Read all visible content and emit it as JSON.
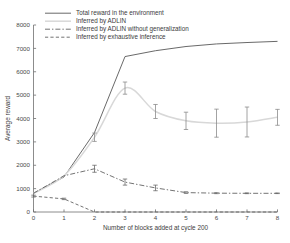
{
  "chart_data": {
    "type": "line",
    "title": "",
    "xlabel": "Number of blocks added at cycle 200",
    "ylabel": "Average reward",
    "xlim": [
      0,
      8
    ],
    "ylim": [
      0,
      8000
    ],
    "xticks": [
      "0",
      "1",
      "2",
      "3",
      "4",
      "5",
      "6",
      "7",
      "8"
    ],
    "yticks": [
      "0",
      "1000",
      "2000",
      "3000",
      "4000",
      "5000",
      "6000",
      "7000",
      "8000"
    ],
    "grid": false,
    "legend_position": "top-left",
    "x": [
      0,
      1,
      2,
      3,
      4,
      5,
      6,
      7,
      8
    ],
    "series": [
      {
        "name": "Total reward in the environment",
        "style": "solid",
        "color": "#585858",
        "values": [
          800,
          1500,
          3400,
          6650,
          6900,
          7080,
          7190,
          7250,
          7300
        ],
        "errors": [
          0,
          0,
          0,
          0,
          0,
          0,
          0,
          0,
          0
        ]
      },
      {
        "name": "Inferred by ADLIN",
        "style": "dotted-light",
        "color": "#d8d8d8",
        "values": [
          800,
          1550,
          3200,
          5300,
          4300,
          3900,
          3800,
          3850,
          4050
        ],
        "errors": [
          0,
          0,
          180,
          260,
          300,
          370,
          600,
          640,
          340
        ]
      },
      {
        "name": "Inferred by ADLIN without generalization",
        "style": "dash-dot",
        "color": "#5a5a5a",
        "values": [
          800,
          1550,
          1850,
          1280,
          1030,
          830,
          805,
          800,
          800
        ],
        "errors": [
          0,
          0,
          150,
          130,
          120,
          35,
          20,
          15,
          12
        ]
      },
      {
        "name": "Inferred by exhaustive inference",
        "style": "dashed",
        "color": "#5a5a5a",
        "values": [
          680,
          560,
          0,
          0,
          0,
          0,
          0,
          0,
          0
        ],
        "errors": [
          40,
          30,
          0,
          0,
          0,
          0,
          0,
          0,
          0
        ]
      }
    ]
  },
  "legend": {
    "items": [
      {
        "label": "Total reward in the environment",
        "style": "solid"
      },
      {
        "label": "Inferred by ADLIN",
        "style": "dotted-light"
      },
      {
        "label": "Inferred by ADLIN without generalization",
        "style": "dash-dot"
      },
      {
        "label": "Inferred by exhaustive inference",
        "style": "dashed"
      }
    ]
  },
  "axes": {
    "x_title": "Number of blocks added at cycle 200",
    "y_title": "Average reward",
    "x_tick_labels": [
      "0",
      "1",
      "2",
      "3",
      "4",
      "5",
      "6",
      "7",
      "8"
    ],
    "y_tick_labels": [
      "0",
      "1000",
      "2000",
      "3000",
      "4000",
      "5000",
      "6000",
      "7000",
      "8000"
    ]
  }
}
